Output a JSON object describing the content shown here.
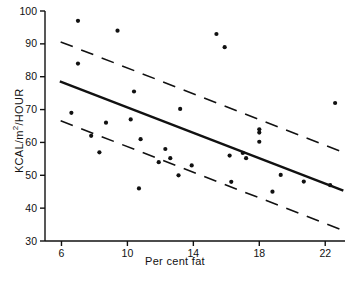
{
  "chart_data": {
    "type": "scatter",
    "title": "",
    "xlabel": "Per cent fat",
    "ylabel": "KCAL/m2/HOUR",
    "ylabel_parts": {
      "pre": "KCAL/",
      "unit_base": "m",
      "unit_sup": "2",
      "post": "/HOUR"
    },
    "xlim": [
      5.0,
      23.2
    ],
    "ylim": [
      30,
      100
    ],
    "xticks": [
      6,
      10,
      14,
      18,
      22
    ],
    "xtick_labels": [
      "6",
      "10",
      "14",
      "18",
      "22"
    ],
    "yticks": [
      30,
      40,
      50,
      60,
      70,
      80,
      90,
      100
    ],
    "ytick_labels": [
      "30",
      "40",
      "50",
      "60",
      "70",
      "80",
      "90",
      "100"
    ],
    "grid": false,
    "legend": null,
    "marker": {
      "shape": "circle",
      "color": "#111111",
      "size_px": 4.2
    },
    "points": [
      {
        "x": 7.0,
        "y": 97.0
      },
      {
        "x": 9.4,
        "y": 94.0
      },
      {
        "x": 15.4,
        "y": 93.0
      },
      {
        "x": 15.9,
        "y": 89.0
      },
      {
        "x": 7.0,
        "y": 84.0
      },
      {
        "x": 10.4,
        "y": 75.5
      },
      {
        "x": 22.6,
        "y": 72.0
      },
      {
        "x": 13.2,
        "y": 70.2
      },
      {
        "x": 6.6,
        "y": 69.0
      },
      {
        "x": 8.7,
        "y": 66.0
      },
      {
        "x": 10.2,
        "y": 67.0
      },
      {
        "x": 18.0,
        "y": 64.0
      },
      {
        "x": 18.0,
        "y": 63.0
      },
      {
        "x": 7.8,
        "y": 62.0
      },
      {
        "x": 10.8,
        "y": 61.0
      },
      {
        "x": 18.0,
        "y": 60.2
      },
      {
        "x": 12.3,
        "y": 58.0
      },
      {
        "x": 8.3,
        "y": 57.0
      },
      {
        "x": 17.0,
        "y": 56.8
      },
      {
        "x": 16.2,
        "y": 56.0
      },
      {
        "x": 17.2,
        "y": 55.2
      },
      {
        "x": 12.6,
        "y": 55.2
      },
      {
        "x": 11.9,
        "y": 54.0
      },
      {
        "x": 13.9,
        "y": 53.0
      },
      {
        "x": 13.1,
        "y": 50.0
      },
      {
        "x": 19.3,
        "y": 50.1
      },
      {
        "x": 20.7,
        "y": 48.1
      },
      {
        "x": 16.3,
        "y": 48.0
      },
      {
        "x": 22.3,
        "y": 47.0
      },
      {
        "x": 10.7,
        "y": 46.0
      },
      {
        "x": 18.8,
        "y": 45.0
      }
    ],
    "fit_line": {
      "style": "solid",
      "color": "#111111",
      "x_start": 5.9,
      "y_start": 78.6,
      "x_end": 23.1,
      "y_end": 45.3
    },
    "bands": [
      {
        "name": "upper-limit-band",
        "style": "dashed",
        "color": "#111111",
        "x_start": 5.95,
        "y_start": 90.6,
        "x_end": 23.1,
        "y_end": 57.0
      },
      {
        "name": "lower-limit-band",
        "style": "dashed",
        "color": "#111111",
        "x_start": 5.95,
        "y_start": 66.6,
        "x_end": 23.1,
        "y_end": 33.2
      }
    ]
  }
}
